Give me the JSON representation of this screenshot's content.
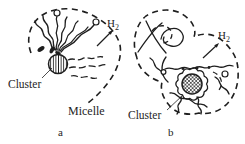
{
  "figure": {
    "background_color": "#ffffff",
    "ink_color": "#1e1e1e",
    "panel_a": {
      "panel_letter": "a",
      "gas_label": {
        "main": "H",
        "subscript": "2"
      },
      "cluster_label": "Cluster",
      "micelle_label": "Micelle"
    },
    "panel_b": {
      "panel_letter": "b",
      "gas_label": {
        "main": "H",
        "subscript": "2"
      },
      "cluster_label": "Cluster"
    }
  }
}
